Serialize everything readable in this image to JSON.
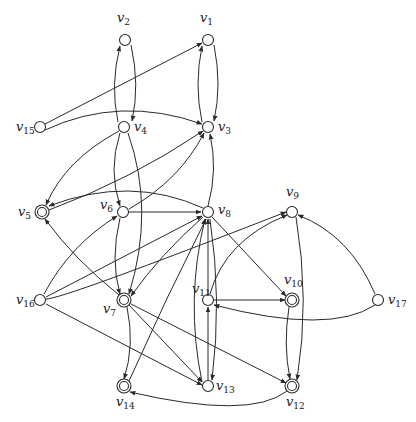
{
  "diagram": {
    "type": "directed-graph",
    "colors": {
      "stroke": "#2a2a2a",
      "background": "#ffffff",
      "text": "#222222"
    },
    "nodes": [
      {
        "id": "v1",
        "label": "v",
        "sub": "1",
        "x": 208,
        "y": 40,
        "accepting": false,
        "lx": 200,
        "ly": 22
      },
      {
        "id": "v2",
        "label": "v",
        "sub": "2",
        "x": 125,
        "y": 40,
        "accepting": false,
        "lx": 117,
        "ly": 22
      },
      {
        "id": "v3",
        "label": "v",
        "sub": "3",
        "x": 208,
        "y": 127,
        "accepting": false,
        "lx": 218,
        "ly": 131
      },
      {
        "id": "v4",
        "label": "v",
        "sub": "4",
        "x": 124,
        "y": 127,
        "accepting": false,
        "lx": 134,
        "ly": 131
      },
      {
        "id": "v5",
        "label": "v",
        "sub": "5",
        "x": 42,
        "y": 212,
        "accepting": true,
        "lx": 18,
        "ly": 216
      },
      {
        "id": "v6",
        "label": "v",
        "sub": "6",
        "x": 123,
        "y": 212,
        "accepting": false,
        "lx": 100,
        "ly": 209
      },
      {
        "id": "v7",
        "label": "v",
        "sub": "7",
        "x": 124,
        "y": 300,
        "accepting": true,
        "lx": 103,
        "ly": 313
      },
      {
        "id": "v8",
        "label": "v",
        "sub": "8",
        "x": 208,
        "y": 212,
        "accepting": false,
        "lx": 218,
        "ly": 214
      },
      {
        "id": "v9",
        "label": "v",
        "sub": "9",
        "x": 292,
        "y": 212,
        "accepting": false,
        "lx": 286,
        "ly": 196
      },
      {
        "id": "v10",
        "label": "v",
        "sub": "10",
        "x": 292,
        "y": 300,
        "accepting": true,
        "lx": 284,
        "ly": 284
      },
      {
        "id": "v11",
        "label": "v",
        "sub": "11",
        "x": 208,
        "y": 300,
        "accepting": false,
        "lx": 192,
        "ly": 293
      },
      {
        "id": "v12",
        "label": "v",
        "sub": "12",
        "x": 292,
        "y": 386,
        "accepting": true,
        "lx": 286,
        "ly": 406
      },
      {
        "id": "v13",
        "label": "v",
        "sub": "13",
        "x": 208,
        "y": 386,
        "accepting": false,
        "lx": 216,
        "ly": 390
      },
      {
        "id": "v14",
        "label": "v",
        "sub": "14",
        "x": 124,
        "y": 386,
        "accepting": true,
        "lx": 116,
        "ly": 406
      },
      {
        "id": "v15",
        "label": "v",
        "sub": "15",
        "x": 40,
        "y": 127,
        "accepting": false,
        "lx": 16,
        "ly": 131
      },
      {
        "id": "v16",
        "label": "v",
        "sub": "16",
        "x": 40,
        "y": 300,
        "accepting": false,
        "lx": 16,
        "ly": 304
      },
      {
        "id": "v17",
        "label": "v",
        "sub": "17",
        "x": 378,
        "y": 300,
        "accepting": false,
        "lx": 388,
        "ly": 304
      }
    ],
    "edges": [
      {
        "from": "v2",
        "to": "v4",
        "path": "M131,45 Q140,85 132,121"
      },
      {
        "from": "v4",
        "to": "v2",
        "path": "M118,122 Q110,85 120,46"
      },
      {
        "from": "v1",
        "to": "v3",
        "path": "M214,45 Q222,85 214,121"
      },
      {
        "from": "v3",
        "to": "v1",
        "path": "M202,122 Q194,85 202,46"
      },
      {
        "from": "v15",
        "to": "v1",
        "path": "M45,124 L202,43"
      },
      {
        "from": "v15",
        "to": "v3",
        "path": "M45,130 Q120,95 202,124"
      },
      {
        "from": "v4",
        "to": "v5",
        "path": "M119,131 Q65,160 46,205"
      },
      {
        "from": "v4",
        "to": "v6",
        "path": "M120,133 Q108,170 120,206"
      },
      {
        "from": "v4",
        "to": "v7",
        "path": "M128,133 Q155,210 129,294"
      },
      {
        "from": "v5",
        "to": "v3",
        "path": "M49,210 Q130,180 203,131"
      },
      {
        "from": "v6",
        "to": "v3",
        "path": "M129,209 Q180,180 204,133"
      },
      {
        "from": "v8",
        "to": "v3",
        "path": "M208,206 Q218,170 210,134"
      },
      {
        "from": "v8",
        "to": "v5",
        "path": "M203,208 Q130,175 49,206"
      },
      {
        "from": "v6",
        "to": "v8",
        "path": "M129,212 L201,212"
      },
      {
        "from": "v6",
        "to": "v7",
        "path": "M120,218 Q110,260 120,294"
      },
      {
        "from": "v16",
        "to": "v6",
        "path": "M44,294 Q70,245 117,216"
      },
      {
        "from": "v16",
        "to": "v8",
        "path": "M46,297 L202,216"
      },
      {
        "from": "v7",
        "to": "v5",
        "path": "M119,295 Q75,260 45,219"
      },
      {
        "from": "v8",
        "to": "v7",
        "path": "M203,217 Q160,255 131,296"
      },
      {
        "from": "v8",
        "to": "v10",
        "path": "M212,217 L286,296"
      },
      {
        "from": "v11",
        "to": "v8",
        "path": "M208,294 L208,219"
      },
      {
        "from": "v11",
        "to": "v10",
        "path": "M214,300 L285,300"
      },
      {
        "from": "v11",
        "to": "v9",
        "path": "M210,294 Q225,240 287,215"
      },
      {
        "from": "v16",
        "to": "v9",
        "path": "M46,299 Q60,300 286,212"
      },
      {
        "from": "v17",
        "to": "v9",
        "path": "M375,294 Q350,235 298,215"
      },
      {
        "from": "v17",
        "to": "v11",
        "path": "M375,305 Q330,335 214,305"
      },
      {
        "from": "v9",
        "to": "v12",
        "path": "M296,217 Q310,300 297,380"
      },
      {
        "from": "v10",
        "to": "v12",
        "path": "M289,307 Q283,345 290,379"
      },
      {
        "from": "v13",
        "to": "v11",
        "path": "M208,380 L208,307"
      },
      {
        "from": "v13",
        "to": "v8",
        "path": "M202,382 Q185,300 205,219"
      },
      {
        "from": "v14",
        "to": "v8",
        "path": "M129,381 Q165,300 206,219"
      },
      {
        "from": "v7",
        "to": "v14",
        "path": "M127,307 Q135,345 124,379"
      },
      {
        "from": "v7",
        "to": "v13",
        "path": "M129,305 L202,382"
      },
      {
        "from": "v7",
        "to": "v12",
        "path": "M131,304 L286,383"
      },
      {
        "from": "v16",
        "to": "v13",
        "path": "M46,304 L202,385"
      },
      {
        "from": "v12",
        "to": "v14",
        "path": "M287,391 Q250,420 130,392"
      },
      {
        "from": "v8",
        "to": "v13",
        "path": "M210,219 Q222,300 212,380"
      }
    ]
  }
}
